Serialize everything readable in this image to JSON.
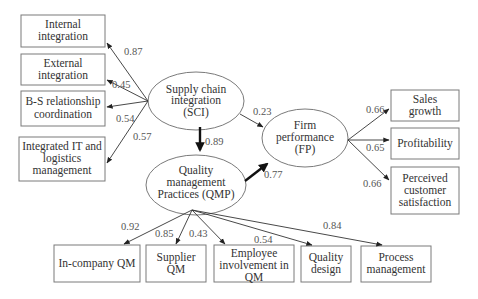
{
  "diagram": {
    "latent": {
      "sci": {
        "lines": [
          "Supply chain",
          "integration",
          "(SCI)"
        ]
      },
      "qmp": {
        "lines": [
          "Quality",
          "management",
          "Practices (QMP)"
        ]
      },
      "fp": {
        "lines": [
          "Firm",
          "performance",
          "(FP)"
        ]
      }
    },
    "sci_indicators": [
      {
        "lines": [
          "Internal",
          "integration"
        ],
        "loading": "0.87"
      },
      {
        "lines": [
          "External",
          "integration"
        ],
        "loading": "0.45"
      },
      {
        "lines": [
          "B-S relationship",
          "coordination"
        ],
        "loading": "0.54"
      },
      {
        "lines": [
          "Integrated IT and",
          "logistics",
          "management"
        ],
        "loading": "0.57"
      }
    ],
    "qmp_indicators": [
      {
        "lines": [
          "In-company QM"
        ],
        "loading": "0.92"
      },
      {
        "lines": [
          "Supplier",
          "QM"
        ],
        "loading": "0.85"
      },
      {
        "lines": [
          "Employee",
          "involvement in",
          "QM"
        ],
        "loading": "0.43"
      },
      {
        "lines": [
          "Quality",
          "design"
        ],
        "loading": "0.54"
      },
      {
        "lines": [
          "Process",
          "management"
        ],
        "loading": "0.84"
      }
    ],
    "fp_indicators": [
      {
        "lines": [
          "Sales",
          "growth"
        ],
        "loading": "0.66"
      },
      {
        "lines": [
          "Profitability"
        ],
        "loading": "0.65"
      },
      {
        "lines": [
          "Perceived",
          "customer",
          "satisfaction"
        ],
        "loading": "0.66"
      }
    ],
    "paths": {
      "sci_to_qmp": "0.89",
      "sci_to_fp": "0.23",
      "qmp_to_fp": "0.77"
    }
  }
}
